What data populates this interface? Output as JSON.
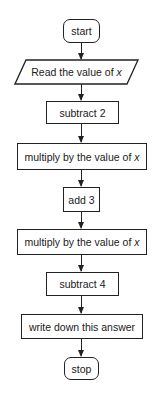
{
  "flowchart": {
    "nodes": [
      {
        "id": "start",
        "type": "terminal",
        "label": "start"
      },
      {
        "id": "read",
        "type": "input-output",
        "label": "Read the value of ",
        "variable": "x"
      },
      {
        "id": "sub2",
        "type": "process",
        "label": "subtract 2"
      },
      {
        "id": "mul1",
        "type": "process",
        "label": "multiply by the value of ",
        "variable": "x"
      },
      {
        "id": "add3",
        "type": "process",
        "label": "add 3"
      },
      {
        "id": "mul2",
        "type": "process",
        "label": "multiply by the value of ",
        "variable": "x"
      },
      {
        "id": "sub4",
        "type": "process",
        "label": "subtract 4"
      },
      {
        "id": "write",
        "type": "process",
        "label": "write down this answer"
      },
      {
        "id": "stop",
        "type": "terminal",
        "label": "stop"
      }
    ],
    "edges": [
      [
        "start",
        "read"
      ],
      [
        "read",
        "sub2"
      ],
      [
        "sub2",
        "mul1"
      ],
      [
        "mul1",
        "add3"
      ],
      [
        "add3",
        "mul2"
      ],
      [
        "mul2",
        "sub4"
      ],
      [
        "sub4",
        "write"
      ],
      [
        "write",
        "stop"
      ]
    ],
    "colors": {
      "stroke": "#222222",
      "fill": "#ffffff",
      "text": "#1a1a1a"
    }
  }
}
